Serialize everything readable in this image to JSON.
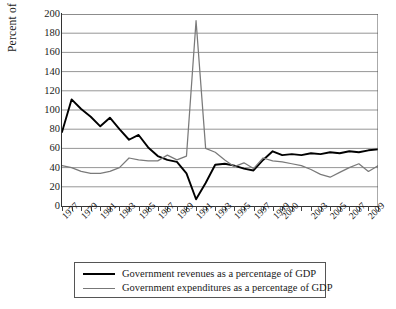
{
  "chart_data": {
    "type": "line",
    "title": "",
    "xlabel": "",
    "ylabel": "Percent of GDP",
    "ylim": [
      0,
      200
    ],
    "ytick_step": 20,
    "yticks": [
      0,
      20,
      40,
      60,
      80,
      100,
      120,
      140,
      160,
      180,
      200
    ],
    "grid": true,
    "legend_position": "below-plot",
    "xlim": [
      1977,
      2010
    ],
    "x": [
      1977,
      1978,
      1979,
      1980,
      1981,
      1982,
      1983,
      1984,
      1985,
      1986,
      1987,
      1988,
      1989,
      1990,
      1991,
      1992,
      1993,
      1994,
      1995,
      1996,
      1997,
      1998,
      1999,
      2000,
      2001,
      2002,
      2003,
      2004,
      2005,
      2006,
      2007,
      2008,
      2009,
      2010
    ],
    "xtick_labels": [
      "1977",
      "1979",
      "1981",
      "1983",
      "1985",
      "1987",
      "1989",
      "1991",
      "1993",
      "1995",
      "1997",
      "1999",
      "2000",
      "2003",
      "2005",
      "2007",
      "2009"
    ],
    "xtick_values": [
      1977,
      1979,
      1981,
      1983,
      1985,
      1987,
      1989,
      1991,
      1993,
      1995,
      1997,
      1999,
      2000,
      2003,
      2005,
      2007,
      2009
    ],
    "colors": {
      "revenues": "#000000",
      "expenditures": "#7a7a7a"
    },
    "series": [
      {
        "name": "Government revenues as a percentage of GDP",
        "color": "#000000",
        "values": [
          77,
          111,
          101,
          93,
          83,
          92,
          80,
          69,
          74,
          61,
          52,
          48,
          46,
          34,
          7,
          24,
          43,
          44,
          42,
          39,
          37,
          48,
          57,
          53,
          54,
          53,
          55,
          54,
          56,
          55,
          57,
          56,
          58,
          59
        ]
      },
      {
        "name": "Government expenditures as a percentage of GDP",
        "color": "#7a7a7a",
        "values": [
          42,
          40,
          36,
          34,
          34,
          36,
          40,
          50,
          48,
          47,
          47,
          53,
          48,
          52,
          193,
          60,
          56,
          48,
          41,
          45,
          39,
          50,
          47,
          46,
          44,
          42,
          38,
          33,
          30,
          35,
          40,
          44,
          36,
          42
        ]
      }
    ]
  },
  "legend": {
    "items": [
      {
        "label": "Government revenues as a percentage of GDP",
        "style": "rev"
      },
      {
        "label": "Government expenditures as a percentage of GDP",
        "style": "exp"
      }
    ]
  }
}
